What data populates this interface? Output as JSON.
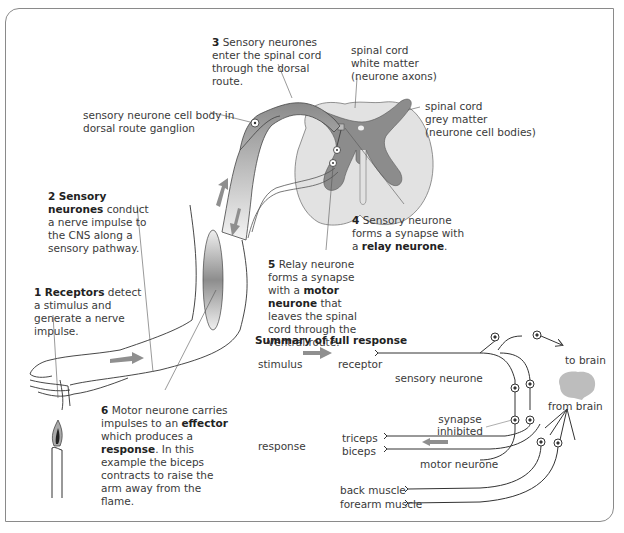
{
  "figure": {
    "annotations": {
      "step3": {
        "num": "3",
        "text": "Sensory neurones enter the spinal cord through the dorsal route."
      },
      "white_matter": "spinal cord\nwhite matter\n(neurone axons)",
      "grey_matter": "spinal cord\ngrey matter\n(neurone cell bodies)",
      "cell_body": "sensory neurone cell body in\ndorsal route ganglion",
      "step2": {
        "num": "2",
        "bold": "Sensory neurones",
        "text": "conduct a nerve impulse to the CNS along a sensory pathway."
      },
      "step4": {
        "num": "4",
        "text": "Sensory neurone forms a synapse with a ",
        "bold": "relay neurone",
        "end": "."
      },
      "step5": {
        "num": "5",
        "text1": "Relay neurone forms a synapse with a ",
        "bold": "motor neurone",
        "text2": " that leaves the spinal cord through the ventral route."
      },
      "step1": {
        "num": "1",
        "bold": "Receptors",
        "text": " detect a stimulus and generate a nerve impulse."
      },
      "step6": {
        "num": "6",
        "text1": "Motor neurone carries impulses to an ",
        "bold1": "effector",
        "text2": " which produces a ",
        "bold2": "response",
        "text3": ". In this example the biceps contracts to raise the arm away from the flame."
      }
    },
    "summary": {
      "title": "Summary of full response",
      "stimulus": "stimulus",
      "receptor": "receptor",
      "sensory_neurone": "sensory neurone",
      "to_brain": "to brain",
      "from_brain": "from brain",
      "synapse_inhibited": "synapse\ninhibited",
      "response": "response",
      "triceps": "triceps",
      "biceps": "biceps",
      "motor_neurone": "motor neurone",
      "back_muscle": "back muscle",
      "forearm_muscle": "forearm muscle"
    },
    "colors": {
      "grey_matter": "#8c8c8c",
      "white_matter": "#e0e0e0",
      "arrow": "#8f8f8f",
      "line": "#333333",
      "brain": "#bdbdbd"
    }
  }
}
